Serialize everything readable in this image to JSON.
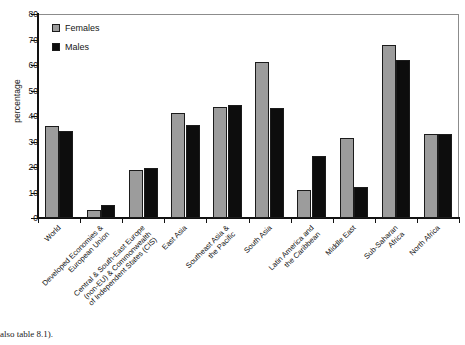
{
  "chart_data": {
    "type": "bar",
    "title": "",
    "xlabel": "",
    "ylabel": "percentage",
    "ylim": [
      0,
      80
    ],
    "yticks": [
      0,
      10,
      20,
      30,
      40,
      50,
      60,
      70,
      80
    ],
    "grid": false,
    "legend_position": "upper-left",
    "categories": [
      "World",
      "Developed Economies &\nEuropean Union",
      "Central & South-East Europe\n(non-EU) & Commonwealth\nof Independent States (CIS)",
      "East Asia",
      "Southeast Asia &\nthe Pacific",
      "South Asia",
      "Latin America and\nthe Caribbean",
      "Middle East",
      "Sub-Saharan\nAfrica",
      "North Africa"
    ],
    "series": [
      {
        "name": "Females",
        "color": "#9c9c9c",
        "values": [
          36,
          3,
          19,
          41,
          43.5,
          61,
          11,
          31.5,
          68,
          33
        ]
      },
      {
        "name": "Males",
        "color": "#0d0d0d",
        "values": [
          34,
          5,
          19.5,
          36.5,
          44.5,
          43,
          24.5,
          12,
          62,
          33
        ]
      }
    ]
  },
  "legend": {
    "items": [
      {
        "label": "Females"
      },
      {
        "label": "Males"
      }
    ]
  },
  "caption": {
    "text": "also table 8.1)."
  },
  "colors": {
    "female": "#9c9c9c",
    "male": "#0d0d0d",
    "axis": "#121212",
    "frame": "#8c8c8c",
    "background": "#ffffff"
  }
}
